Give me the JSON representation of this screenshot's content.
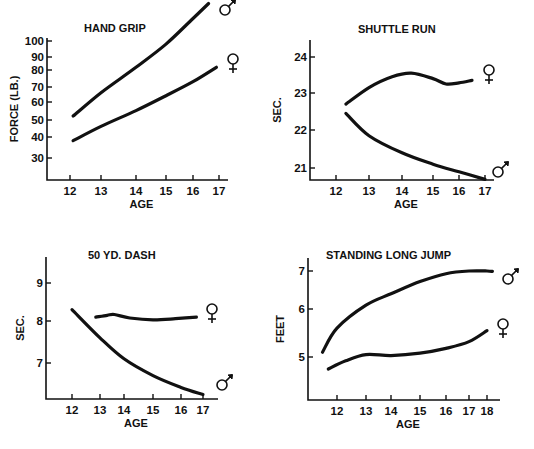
{
  "figure": {
    "caption": ""
  },
  "chart_data": [
    {
      "type": "line",
      "id": "hand_grip",
      "title": "HAND GRIP",
      "xlabel": "AGE",
      "ylabel": "FORCE (LB.)",
      "xticks": [
        12,
        13,
        14,
        15,
        16,
        17
      ],
      "yticks": [
        30,
        40,
        50,
        60,
        70,
        80,
        90,
        100
      ],
      "yscale": "log",
      "grid": false,
      "series": [
        {
          "name": "Male",
          "symbol": "♂",
          "x": [
            12.1,
            13,
            14,
            15,
            16,
            16.6
          ],
          "values": [
            52,
            66,
            82,
            98,
            116,
            128
          ]
        },
        {
          "name": "Female",
          "symbol": "♀",
          "x": [
            12.1,
            13,
            14,
            15,
            16,
            16.9
          ],
          "values": [
            38,
            46,
            55,
            64,
            73,
            82
          ]
        }
      ]
    },
    {
      "type": "line",
      "id": "shuttle_run",
      "title": "SHUTTLE RUN",
      "xlabel": "AGE",
      "ylabel": "SEC.",
      "xticks": [
        12,
        13,
        14,
        15,
        16,
        17
      ],
      "yticks": [
        21,
        22,
        23,
        24
      ],
      "ylim": [
        20.7,
        24.4
      ],
      "grid": false,
      "series": [
        {
          "name": "Female",
          "symbol": "♀",
          "x": [
            12.3,
            13,
            13.7,
            14.3,
            15,
            15.5,
            16,
            16.5
          ],
          "values": [
            22.7,
            23.15,
            23.45,
            23.55,
            23.4,
            23.25,
            23.28,
            23.35
          ]
        },
        {
          "name": "Male",
          "symbol": "♂",
          "x": [
            12.3,
            13,
            14,
            15,
            16,
            17
          ],
          "values": [
            22.45,
            21.85,
            21.4,
            21.1,
            20.9,
            20.7
          ]
        }
      ]
    },
    {
      "type": "line",
      "id": "fifty_yd_dash",
      "title": "50 YD. DASH",
      "xlabel": "AGE",
      "ylabel": "SEC.",
      "xticks": [
        12,
        13,
        14,
        15,
        16,
        17
      ],
      "yticks": [
        7,
        8,
        9
      ],
      "ylim": [
        6.15,
        9.7
      ],
      "grid": false,
      "series": [
        {
          "name": "Female",
          "symbol": "♀",
          "x": [
            12.85,
            13.3,
            13.6,
            14.2,
            15,
            15.8,
            16.7
          ],
          "values": [
            8.1,
            8.15,
            8.17,
            8.08,
            8.03,
            8.06,
            8.1
          ]
        },
        {
          "name": "Male",
          "symbol": "♂",
          "x": [
            12,
            13,
            14,
            15,
            16,
            17
          ],
          "values": [
            8.3,
            7.6,
            7.1,
            6.7,
            6.42,
            6.25
          ]
        }
      ]
    },
    {
      "type": "line",
      "id": "standing_long_jump",
      "title": "STANDING LONG JUMP",
      "xlabel": "AGE",
      "ylabel": "FEET",
      "xticks": [
        12,
        13,
        14,
        15,
        16,
        17,
        18
      ],
      "yticks": [
        5,
        6,
        7
      ],
      "ylim": [
        4.1,
        7.35
      ],
      "grid": false,
      "series": [
        {
          "name": "Male",
          "symbol": "♂",
          "x": [
            11.5,
            12,
            13,
            14,
            15,
            16,
            17,
            18,
            18.3
          ],
          "values": [
            5.1,
            5.6,
            6.1,
            6.4,
            6.72,
            6.93,
            7.0,
            7.0,
            6.99
          ]
        },
        {
          "name": "Female",
          "symbol": "♀",
          "x": [
            11.7,
            12.3,
            13,
            14,
            15,
            16,
            17,
            18
          ],
          "values": [
            4.75,
            4.92,
            5.05,
            5.03,
            5.08,
            5.18,
            5.32,
            5.55
          ]
        }
      ]
    }
  ]
}
